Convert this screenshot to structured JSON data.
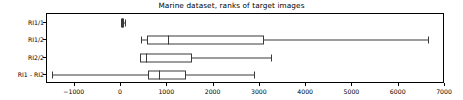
{
  "chart_data": {
    "type": "boxplot",
    "title": "Marine dataset, ranks of target images",
    "xlabel": "",
    "ylabel": "",
    "orientation": "horizontal",
    "xlim": [
      -1600,
      7000
    ],
    "xticks": [
      -1000,
      0,
      1000,
      2000,
      3000,
      4000,
      5000,
      6000,
      7000
    ],
    "xticklabels": [
      "−1000",
      "0",
      "1000",
      "2000",
      "3000",
      "4000",
      "5000",
      "6000",
      "7000"
    ],
    "grid": false,
    "legend": false,
    "categories": [
      "RI1/1",
      "RI1/2",
      "RI2/2",
      "RI1 - RI2"
    ],
    "boxes": [
      {
        "label": "RI1/1",
        "whisker_low": 0,
        "q1": 0,
        "median": 20,
        "q3": 60,
        "whisker_high": 80
      },
      {
        "label": "RI1/2",
        "whisker_low": 440,
        "q1": 565,
        "median": 1005,
        "q3": 3080,
        "whisker_high": 6630
      },
      {
        "label": "RI2/2",
        "whisker_low": 400,
        "q1": 420,
        "median": 545,
        "q3": 1530,
        "whisker_high": 3250
      },
      {
        "label": "RI1 - RI2",
        "whisker_low": -1500,
        "q1": 590,
        "median": 820,
        "q3": 1405,
        "whisker_high": 2880
      }
    ]
  }
}
